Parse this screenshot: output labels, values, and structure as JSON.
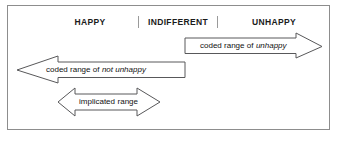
{
  "figure": {
    "name": "coded-and-implicated-range-diagram",
    "scale": {
      "labels": [
        {
          "id": "happy",
          "text": "HAPPY"
        },
        {
          "id": "indifferent",
          "text": "INDIFFERENT"
        },
        {
          "id": "unhappy",
          "text": "UNHAPPY"
        }
      ],
      "divider_glyph": "|"
    },
    "arrows": [
      {
        "id": "coded-range-unhappy",
        "direction": "right",
        "label_prefix": "coded range of",
        "label_emphasis": "unhappy"
      },
      {
        "id": "coded-range-not-unhappy",
        "direction": "left",
        "label_prefix": "coded range of",
        "label_emphasis": "not unhappy"
      },
      {
        "id": "implicated-range",
        "direction": "both",
        "label_prefix": "implicated",
        "label_emphasis": "range"
      }
    ],
    "colors": {
      "frame_border": "#8d8d8d",
      "arrow_stroke": "#58585a",
      "arrow_fill": "#ffffff",
      "text": "#111111",
      "background": "#ffffff"
    }
  }
}
